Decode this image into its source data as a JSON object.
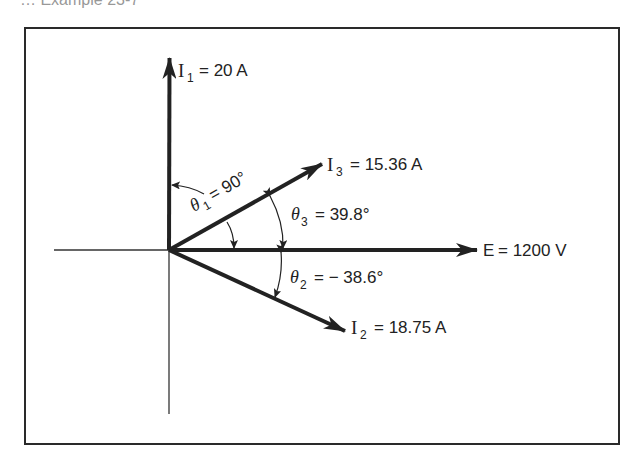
{
  "caption": {
    "text": "… Example 23-7"
  },
  "diagram": {
    "type": "phasor",
    "colors": {
      "ink": "#222222",
      "background": "#ffffff"
    },
    "origin": [
      169,
      250
    ],
    "phasors": [
      {
        "id": "I1",
        "symbol": "I",
        "subscript": "1",
        "value": "= 20 A",
        "angle_deg": 90,
        "tip": [
          170,
          58
        ]
      },
      {
        "id": "I3",
        "symbol": "I",
        "subscript": "3",
        "value": "= 15.36 A",
        "angle_deg": 39.8,
        "tip": [
          322,
          164
        ]
      },
      {
        "id": "E",
        "symbol": "E",
        "subscript": "",
        "value": "= 1200 V",
        "angle_deg": 0,
        "tip": [
          477,
          250
        ]
      },
      {
        "id": "I2",
        "symbol": "I",
        "subscript": "2",
        "value": "= 18.75 A",
        "angle_deg": -38.6,
        "tip": [
          345,
          331
        ]
      }
    ],
    "angles": [
      {
        "id": "theta1",
        "symbol": "θ",
        "subscript": "1",
        "value": "= 90°"
      },
      {
        "id": "theta3",
        "symbol": "θ",
        "subscript": "3",
        "value": "= 39.8°"
      },
      {
        "id": "theta2",
        "symbol": "θ",
        "subscript": "2",
        "value": "= − 38.6°"
      }
    ]
  }
}
